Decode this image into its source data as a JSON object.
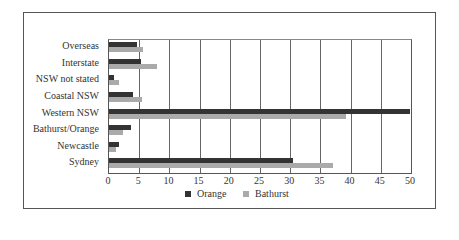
{
  "chart_data": {
    "type": "bar",
    "orientation": "horizontal",
    "title": "",
    "xlabel": "",
    "ylabel": "",
    "xlim": [
      0,
      50
    ],
    "x_ticks": [
      "0",
      "5",
      "10",
      "15",
      "20",
      "25",
      "30",
      "35",
      "40",
      "45",
      "50"
    ],
    "grid": true,
    "legend_position": "bottom",
    "categories": [
      "Overseas",
      "Interstate",
      "NSW not stated",
      "Coastal NSW",
      "Western NSW",
      "Bathurst/Orange",
      "Newcastle",
      "Sydney"
    ],
    "series": [
      {
        "name": "Orange",
        "color": "#333333",
        "values": [
          4.7,
          5.3,
          0.9,
          4.0,
          49.8,
          3.6,
          1.7,
          30.4
        ]
      },
      {
        "name": "Bathurst",
        "color": "#aaaaaa",
        "values": [
          5.7,
          7.9,
          1.6,
          5.4,
          39.2,
          2.4,
          1.1,
          37.1
        ]
      }
    ]
  },
  "legend": {
    "orange": "Orange",
    "bathurst": "Bathurst"
  }
}
